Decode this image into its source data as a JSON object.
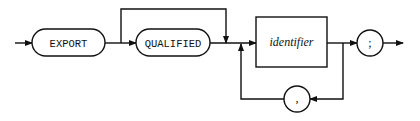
{
  "diagram": {
    "type": "syntax-railroad",
    "nodes": [
      {
        "id": "export",
        "kind": "terminal",
        "label": "EXPORT"
      },
      {
        "id": "qualified",
        "kind": "terminal",
        "label": "QUALIFIED",
        "optional": true
      },
      {
        "id": "identifier",
        "kind": "nonterminal",
        "label": "identifier",
        "repeat": true
      },
      {
        "id": "comma",
        "kind": "terminal",
        "label": ",",
        "role": "repeat-separator"
      },
      {
        "id": "semicolon",
        "kind": "terminal",
        "label": ";"
      }
    ],
    "edges": [
      {
        "from": "start",
        "to": "export"
      },
      {
        "from": "export",
        "to": "qualified"
      },
      {
        "from": "export",
        "to": "identifier",
        "note": "bypass QUALIFIED"
      },
      {
        "from": "qualified",
        "to": "identifier"
      },
      {
        "from": "identifier",
        "to": "semicolon"
      },
      {
        "from": "identifier",
        "to": "comma",
        "note": "loop back"
      },
      {
        "from": "comma",
        "to": "identifier"
      },
      {
        "from": "semicolon",
        "to": "end"
      }
    ],
    "colors": {
      "stroke": "#111111",
      "background": "#ffffff"
    }
  }
}
